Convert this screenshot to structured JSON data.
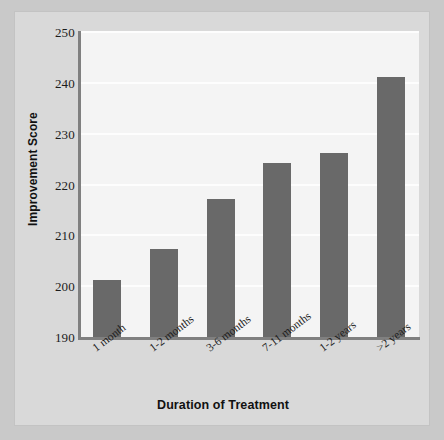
{
  "chart_data": {
    "type": "bar",
    "title": "",
    "subtitle": "",
    "xlabel": "Duration of Treatment",
    "ylabel": "Improvement Score",
    "categories": [
      "1 month",
      "1-2 months",
      "3-6 months",
      "7-11 months",
      "1-2 years",
      ">2 years"
    ],
    "values": [
      201.3,
      207.3,
      217.2,
      224.2,
      226.2,
      241.2
    ],
    "ylim": [
      190,
      250
    ],
    "yticks": [
      190,
      200,
      210,
      220,
      230,
      240,
      250
    ],
    "ytick_labels": [
      "190",
      "200",
      "210",
      "220",
      "230",
      "240",
      "250"
    ],
    "grid": "horizontal",
    "legend": "none",
    "bar_color": "#696969",
    "plot_background": "#f4f4f4",
    "figure_background": "#d9d9d9",
    "gridline_color": "#fdfdfd",
    "axis_color": "#808080",
    "annotations": []
  }
}
